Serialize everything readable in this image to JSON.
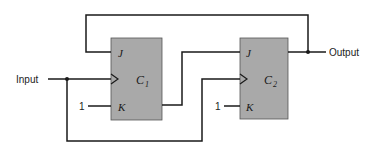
{
  "diagram": {
    "type": "JK flip-flop counter circuit",
    "input_label": "Input",
    "output_label": "Output",
    "flipflops": [
      {
        "name": "C",
        "subscript": "1",
        "pin_j": "J",
        "pin_k": "K",
        "k_value": "1"
      },
      {
        "name": "C",
        "subscript": "2",
        "pin_j": "J",
        "pin_k": "K",
        "k_value": "1"
      }
    ],
    "colors": {
      "box_fill": "#a9a9a9",
      "wire": "#1a1a1a"
    }
  }
}
